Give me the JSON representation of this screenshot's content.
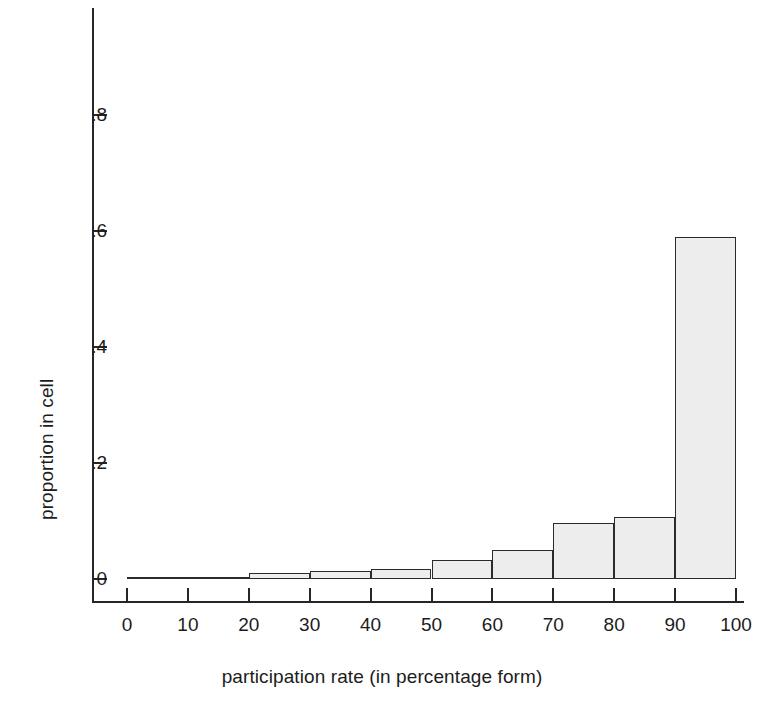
{
  "chart_data": {
    "type": "bar",
    "title": "",
    "subtitle": "",
    "xlabel": "participation rate (in percentage form)",
    "ylabel": "proportion in cell",
    "grid": false,
    "legend": false,
    "xlim": [
      0,
      100
    ],
    "ylim": [
      0,
      0.9
    ],
    "xticks": [
      "0",
      "10",
      "20",
      "30",
      "40",
      "50",
      "60",
      "70",
      "80",
      "90",
      "100"
    ],
    "xtick_values": [
      0,
      10,
      20,
      30,
      40,
      50,
      60,
      70,
      80,
      90,
      100
    ],
    "yticks": [
      "0",
      ".2",
      ".4",
      ".6",
      ".8"
    ],
    "ytick_values": [
      0,
      0.2,
      0.4,
      0.6,
      0.8
    ],
    "bin_edges": [
      0,
      10,
      20,
      30,
      40,
      50,
      60,
      70,
      80,
      90,
      100
    ],
    "categories": [
      "0-10",
      "10-20",
      "20-30",
      "30-40",
      "40-50",
      "50-60",
      "60-70",
      "70-80",
      "80-90",
      "90-100"
    ],
    "values": [
      0.0,
      0.003,
      0.01,
      0.014,
      0.017,
      0.032,
      0.05,
      0.096,
      0.107,
      0.59
    ],
    "bar_fill_color": "#ededed",
    "bar_edge_color": "#2b2b2b",
    "axis_color": "#262626"
  }
}
